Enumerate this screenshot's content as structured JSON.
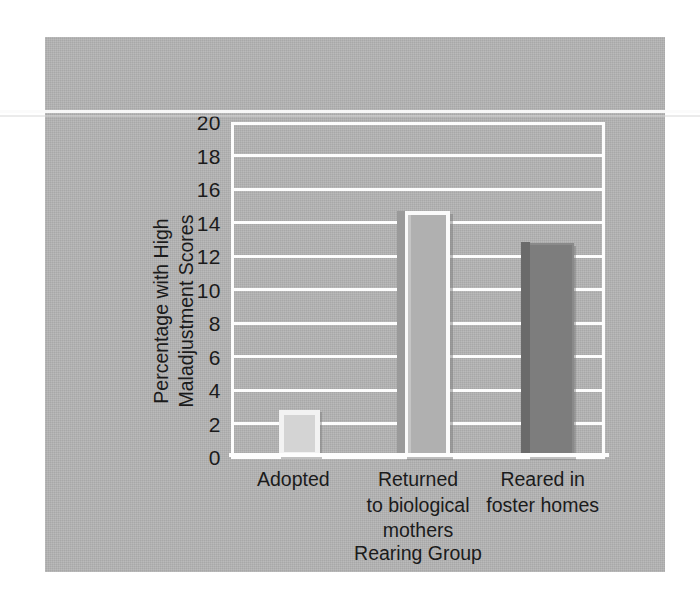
{
  "chart_data": {
    "type": "bar",
    "title": "",
    "xlabel": "Rearing Group",
    "ylabel_lines": [
      "Percentage with High",
      "Maladjustment Scores"
    ],
    "ylabel": "Percentage with High Maladjustment Scores",
    "categories": [
      "Adopted",
      "Returned to biological mothers",
      "Reared in foster homes"
    ],
    "category_lines": [
      [
        "Adopted"
      ],
      [
        "Returned",
        "to biological",
        "mothers"
      ],
      [
        "Reared in",
        "foster homes"
      ]
    ],
    "values": [
      2.8,
      14.7,
      12.8
    ],
    "ylim": [
      0,
      20
    ],
    "ytick_values": [
      20,
      18,
      16,
      14,
      12,
      10,
      8,
      6,
      4,
      2,
      0
    ],
    "ytick_labels": [
      "20",
      "18",
      "16",
      "14",
      "12",
      "10",
      "8",
      "6",
      "4",
      "2",
      "0"
    ],
    "ytick_step": 2,
    "grid": true,
    "grid_color": "#fdfdfd",
    "legend": "none",
    "bar_styles": [
      "light",
      "outline",
      "dark"
    ],
    "bar_colors": [
      "#d4d4d4",
      "#b0b0b0",
      "#7d7d7d"
    ],
    "panel_color": "#b4b4b4",
    "text_color": "#1b1b1b"
  }
}
